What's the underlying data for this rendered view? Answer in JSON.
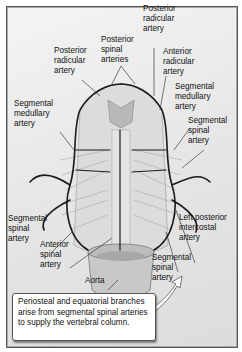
{
  "diagram": {
    "labels": {
      "posterior_radicular_left": "Posterior\nradicular\nartery",
      "posterior_spinal": "Posterior\nspinal\narteries",
      "posterior_radicular_top": "Posterior\nradicular\nartery",
      "anterior_radicular": "Anterior\nradicular\nartery",
      "segmental_medullary_left": "Segmental\nmedullary\nartery",
      "segmental_medullary_right": "Segmental\nmedullary\nartery",
      "segmental_spinal_right_upper": "Segmental\nspinal\nartery",
      "segmental_spinal_left": "Segmental\nspinal\nartery",
      "anterior_spinal": "Anterior\nspinal\nartery",
      "left_posterior_intercostal": "Left posterior\nintercostal\nartery",
      "aorta": "Aorta",
      "segmental_spinal_right_lower": "Segmental\nspinal\nartery"
    },
    "note": "Periosteal and equatorial branches arise from segmental spinal arteries to supply the vertebral column.",
    "colors": {
      "artery": "#1a1a1a",
      "background": "#e8e8e8",
      "tissue": "#d0d0d0"
    }
  }
}
